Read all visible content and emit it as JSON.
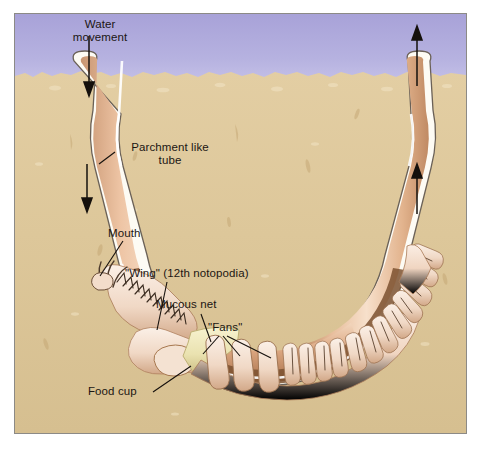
{
  "figure": {
    "frame_border_color": "#8c8a86",
    "background_color": "#ffffff"
  },
  "scene": {
    "water": {
      "name": "water-column",
      "color_top": "#a9a4da",
      "color_bottom": "#bcb8e2",
      "surface_y_label": "sediment surface"
    },
    "sediment": {
      "name": "sand-sediment",
      "color": "#ddc79a",
      "color_shadow": "#c9ad7c",
      "color_highlight": "#ece0c0"
    },
    "tube": {
      "name": "parchment-tube",
      "wall_color": "#fdfbf4",
      "wall_edge_color": "#6b6157",
      "lumen_color_light": "#f5dcc6",
      "lumen_color_mid": "#e2b795",
      "lumen_color_dark": "#b9825d"
    },
    "worm": {
      "body_color_light": "#f7e2d4",
      "body_color_mid": "#e8c6ae",
      "body_color_shadow": "#8d5d3c",
      "mucous_net_color": "#efe9bd",
      "interior_dark": "#6b4428"
    }
  },
  "labels": {
    "water_movement": "Water\nmovement",
    "parchment_tube": "Parchment like\ntube",
    "mouth": "Mouth",
    "wing": "\"Wing\" (12th notopodia)",
    "mucous_net": "Mucous net",
    "fans": "\"Fans\"",
    "food_cup": "Food cup"
  },
  "flow_arrows": [
    {
      "name": "inflow-arrow-top",
      "direction": "down",
      "location": "left tube opening"
    },
    {
      "name": "inflow-arrow-lower",
      "direction": "down",
      "location": "left tube shaft"
    },
    {
      "name": "outflow-arrow-lower",
      "direction": "up",
      "location": "right tube shaft"
    },
    {
      "name": "outflow-arrow-top",
      "direction": "up",
      "location": "right tube opening above sediment"
    }
  ],
  "anatomy": {
    "fan_count": 3,
    "notopodia_pairs": 24,
    "palps": 2
  }
}
